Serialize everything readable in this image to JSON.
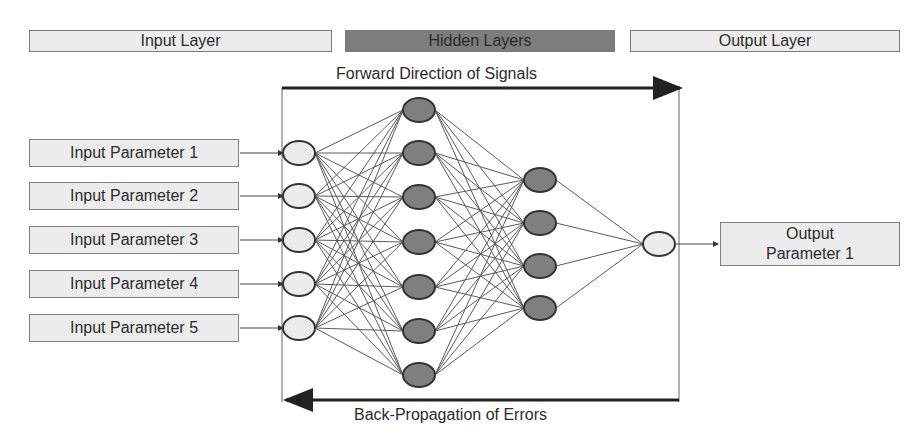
{
  "headers": {
    "input_layer": "Input Layer",
    "hidden_layers": "Hidden Layers",
    "output_layer": "Output Layer"
  },
  "arrows": {
    "forward": "Forward Direction of Signals",
    "backward": "Back-Propagation of Errors"
  },
  "inputs": [
    {
      "label": "Input Parameter 1"
    },
    {
      "label": "Input Parameter 2"
    },
    {
      "label": "Input Parameter 3"
    },
    {
      "label": "Input Parameter 4"
    },
    {
      "label": "Input Parameter 5"
    }
  ],
  "output": {
    "line1": "Output",
    "line2": "Parameter 1"
  },
  "network": {
    "layers": [
      {
        "name": "input",
        "nodes": 5,
        "fill": "#ebebeb"
      },
      {
        "name": "hidden-1",
        "nodes": 7,
        "fill": "#7f7f7f"
      },
      {
        "name": "hidden-2",
        "nodes": 4,
        "fill": "#7f7f7f"
      },
      {
        "name": "output",
        "nodes": 1,
        "fill": "#ebebeb"
      }
    ]
  },
  "colors": {
    "light_fill": "#ececec",
    "dark_fill": "#7d7d7d",
    "line": "#555555"
  }
}
